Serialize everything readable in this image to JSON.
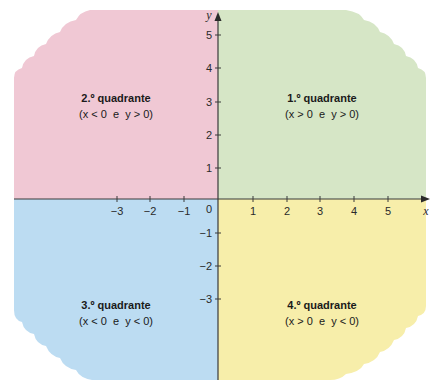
{
  "diagram": {
    "type": "cartesian-plane-quadrants",
    "axes": {
      "x_label": "x",
      "y_label": "y",
      "origin_label": "0",
      "x_ticks": [
        "−3",
        "−2",
        "−1",
        "1",
        "2",
        "3",
        "4",
        "5"
      ],
      "y_ticks": [
        "5",
        "4",
        "3",
        "2",
        "1",
        "−1",
        "−2",
        "−3"
      ]
    },
    "quadrants": [
      {
        "id": "q1",
        "title": "1.º quadrante",
        "condition": "(x > 0  e  y > 0)",
        "color": "#d6e6c6"
      },
      {
        "id": "q2",
        "title": "2.º quadrante",
        "condition": "(x < 0  e  y > 0)",
        "color": "#f0c8d4"
      },
      {
        "id": "q3",
        "title": "3.º quadrante",
        "condition": "(x < 0  e  y < 0)",
        "color": "#bcdcf2"
      },
      {
        "id": "q4",
        "title": "4.º quadrante",
        "condition": "(x > 0  e  y < 0)",
        "color": "#f7eeaa"
      }
    ],
    "axis_color": "#3a3a3a"
  }
}
